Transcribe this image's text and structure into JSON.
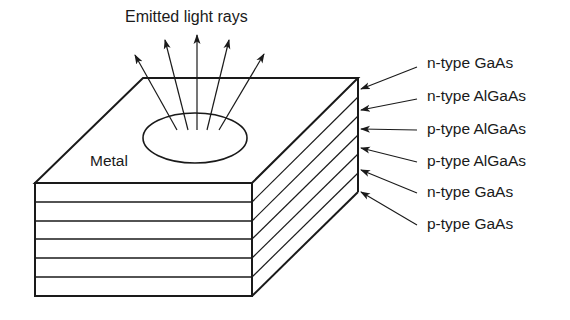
{
  "figure": {
    "title": "Emitted light rays",
    "top_surface_label": "Metal",
    "layers": [
      {
        "label": "n-type GaAs"
      },
      {
        "label": "n-type AlGaAs"
      },
      {
        "label": "p-type AlGaAs"
      },
      {
        "label": "p-type AlGaAs"
      },
      {
        "label": "n-type GaAs"
      },
      {
        "label": "p-type GaAs"
      }
    ],
    "ray_count": 5,
    "stroke_color": "#1a1a1a",
    "background_color": "#ffffff"
  }
}
